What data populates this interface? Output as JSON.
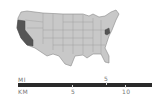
{
  "map": {
    "region": "United States",
    "base_fill": "#c8c8c8",
    "border_color": "#888888",
    "highlight_fill": "#555555",
    "highlighted_states": [
      "California",
      "Maryland",
      "Delaware"
    ]
  },
  "scale_bar": {
    "mi_label": "MI",
    "mi_ticks": [
      "5"
    ],
    "km_label": "KM",
    "km_ticks": [
      "5",
      "10"
    ]
  }
}
